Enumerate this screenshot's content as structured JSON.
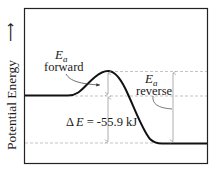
{
  "diagram": {
    "type": "energy-profile",
    "y_axis_label": "Potential Energy",
    "y_axis_arrow": "up-arrow",
    "labels": {
      "ea_forward_symbol": "E",
      "ea_forward_subscript": "a",
      "ea_forward_word": "forward",
      "ea_reverse_symbol": "E",
      "ea_reverse_subscript": "a",
      "ea_reverse_word": "reverse",
      "delta_e_prefix": "Δ",
      "delta_e_symbol": "E",
      "delta_e_value": "= -55.9 kJ"
    },
    "levels": {
      "reactants": "higher",
      "transition_state": "peak",
      "products": "lowest"
    },
    "colors": {
      "curve": "#111111",
      "dashed": "#aaaaaa",
      "arrows": "#999999",
      "frame": "#222222"
    }
  }
}
